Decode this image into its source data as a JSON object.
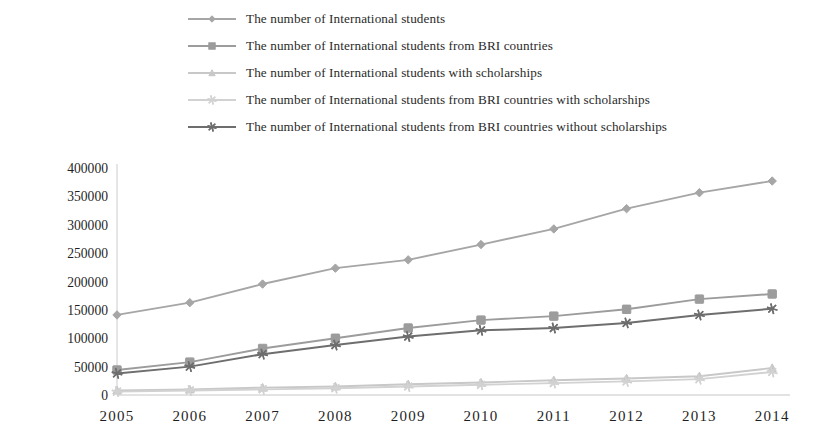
{
  "chart_data": {
    "type": "line",
    "title": "",
    "xlabel": "",
    "ylabel": "",
    "categories": [
      "2005",
      "2006",
      "2007",
      "2008",
      "2009",
      "2010",
      "2011",
      "2012",
      "2013",
      "2014"
    ],
    "x": [
      2005,
      2006,
      2007,
      2008,
      2009,
      2010,
      2011,
      2012,
      2013,
      2014
    ],
    "ylim": [
      0,
      400000
    ],
    "yticks": [
      0,
      50000,
      100000,
      150000,
      200000,
      250000,
      300000,
      350000,
      400000
    ],
    "ytick_labels": [
      "0",
      "50000",
      "100000",
      "150000",
      "200000",
      "250000",
      "300000",
      "350000",
      "400000"
    ],
    "grid": false,
    "legend_position": "top",
    "series": [
      {
        "name": "The number of International students",
        "marker": "diamond",
        "color": "#a6a6a6",
        "values": [
          141087,
          162695,
          195503,
          223499,
          238184,
          265090,
          292611,
          328330,
          356499,
          377054
        ]
      },
      {
        "name": "The number of International students from BRI countries",
        "marker": "square",
        "color": "#9c9c9c",
        "values": [
          44000,
          58000,
          82000,
          100000,
          118000,
          132000,
          139000,
          151000,
          169000,
          178000
        ]
      },
      {
        "name": "The number of International students with scholarships",
        "marker": "triangle",
        "color": "#c8c8c8",
        "values": [
          8000,
          10000,
          13000,
          15000,
          19000,
          22000,
          26000,
          29000,
          33000,
          47600
        ]
      },
      {
        "name": "The number of International students from BRI countries with scholarships",
        "marker": "asterisk",
        "color": "#d2d2d2",
        "values": [
          6000,
          8000,
          10000,
          12000,
          15000,
          18000,
          21000,
          24000,
          28000,
          40500
        ]
      },
      {
        "name": "The number of International students from BRI countries without scholarships",
        "marker": "asterisk",
        "color": "#6e6e6e",
        "values": [
          38000,
          50000,
          72000,
          88000,
          103000,
          114000,
          118000,
          127000,
          141000,
          152000
        ]
      }
    ]
  },
  "colors": {
    "axis": "#bfbfbf",
    "text": "#1f1f1f",
    "background": "#ffffff"
  }
}
